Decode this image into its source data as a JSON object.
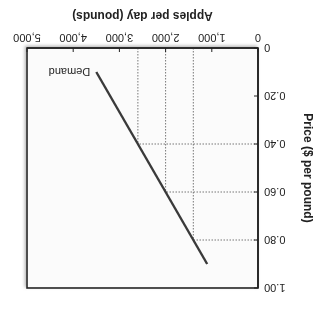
{
  "chart_data": {
    "type": "line",
    "orientation_note": "rendered rotated 180 degrees",
    "title": "",
    "xlabel": "Apples per day (pounds)",
    "ylabel": "Price ($ per pound)",
    "xlim": [
      0,
      5000
    ],
    "ylim": [
      0,
      1.0
    ],
    "x_ticks": [
      "0",
      "1,000",
      "2,000",
      "3,000",
      "4,000",
      "5,000"
    ],
    "x_tick_values": [
      0,
      1000,
      2000,
      3000,
      4000,
      5000
    ],
    "y_ticks": [
      "0",
      "0.20",
      "0.40",
      "0.60",
      "0.80",
      "1.00"
    ],
    "y_tick_values": [
      0,
      0.2,
      0.4,
      0.6,
      0.8,
      1.0
    ],
    "grid": false,
    "series": [
      {
        "name": "Demand",
        "color": "#3a3a3a",
        "points": [
          [
            3500,
            0.1
          ],
          [
            2600,
            0.4
          ],
          [
            2000,
            0.6
          ],
          [
            1400,
            0.8
          ],
          [
            1100,
            0.9
          ]
        ]
      }
    ],
    "reference_lines": [
      {
        "x": 2600,
        "y": 0.4,
        "style": "dotted"
      },
      {
        "x": 2000,
        "y": 0.6,
        "style": "dotted"
      },
      {
        "x": 1400,
        "y": 0.8,
        "style": "dotted"
      }
    ],
    "annotations": [
      {
        "text": "Demand",
        "x": 3500,
        "y": 0.1
      }
    ]
  }
}
